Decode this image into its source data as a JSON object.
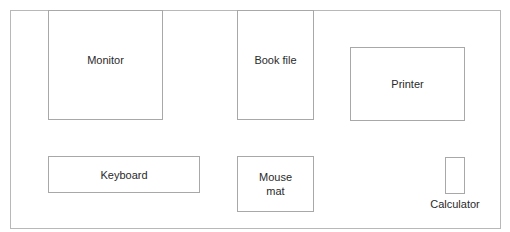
{
  "diagram": {
    "type": "desk layout",
    "items": [
      {
        "id": "monitor",
        "label": "Monitor"
      },
      {
        "id": "book-file",
        "label": "Book file"
      },
      {
        "id": "printer",
        "label": "Printer"
      },
      {
        "id": "keyboard",
        "label": "Keyboard"
      },
      {
        "id": "mouse-mat",
        "label": "Mouse\nmat",
        "label_lines": [
          "Mouse",
          "mat"
        ]
      },
      {
        "id": "calculator",
        "label": "Calculator"
      }
    ]
  }
}
